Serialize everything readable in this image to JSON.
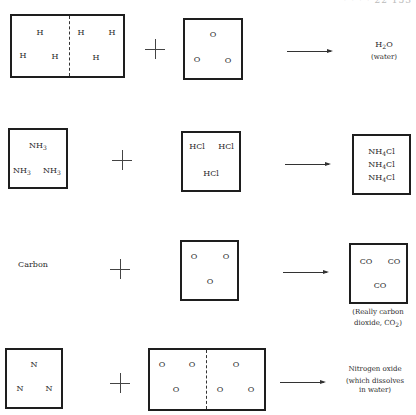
{
  "header": {
    "text": "· · · · 22   153"
  },
  "rows": [
    {
      "reactant1": {
        "atoms": [
          "H",
          "H",
          "H",
          "H",
          "H",
          "H"
        ],
        "containers": 2
      },
      "operator": "plus",
      "reactant2": {
        "atoms": [
          "O",
          "O",
          "O"
        ],
        "containers": 1
      },
      "arrow": "yields",
      "product": {
        "formula_base": "H",
        "formula_sub": "2",
        "formula_tail": "O",
        "note": "(water)"
      }
    },
    {
      "reactant1": {
        "molecule_base": "NH",
        "molecule_sub": "3",
        "count": 3
      },
      "operator": "plus",
      "reactant2": {
        "molecule": "HCl",
        "count": 3
      },
      "arrow": "yields",
      "product": {
        "molecule_base": "NH",
        "molecule_sub": "4",
        "molecule_tail": "Cl",
        "count": 3
      }
    },
    {
      "reactant1": {
        "label": "Carbon"
      },
      "operator": "plus",
      "reactant2": {
        "atoms": [
          "O",
          "O",
          "O"
        ]
      },
      "arrow": "yields",
      "product": {
        "molecule": "CO",
        "count": 3,
        "caption_line1": "(Really carbon",
        "caption_line2_pre": "dioxide, CO",
        "caption_sub": "2",
        "caption_line2_post": ")"
      }
    },
    {
      "reactant1": {
        "atoms": [
          "N",
          "N",
          "N"
        ]
      },
      "operator": "plus",
      "reactant2": {
        "atoms": [
          "O",
          "O",
          "O",
          "O",
          "O",
          "O"
        ],
        "containers": 2
      },
      "arrow": "yields",
      "product": {
        "line1": "Nitrogen oxide",
        "line2": "(which dissolves",
        "line3": "in water)"
      }
    }
  ]
}
